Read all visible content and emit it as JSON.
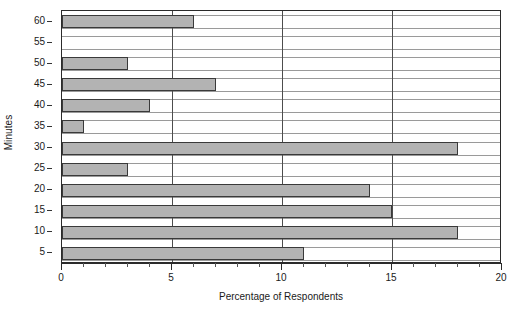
{
  "chart_data": {
    "type": "bar",
    "orientation": "horizontal",
    "title": "",
    "xlabel": "Percentage of Respondents",
    "ylabel": "Minutes",
    "categories": [
      "5",
      "10",
      "15",
      "20",
      "25",
      "30",
      "35",
      "40",
      "45",
      "50",
      "55",
      "60"
    ],
    "values": [
      11,
      18,
      15,
      14,
      3,
      18,
      1,
      4,
      7,
      3,
      0,
      6
    ],
    "xlim": [
      0,
      20
    ],
    "xticks": [
      0,
      5,
      10,
      15,
      20
    ],
    "xtick_labels": [
      "0",
      "5",
      "10",
      "15",
      "20"
    ],
    "x_minor_tick_step": 1,
    "yticks": [
      "5",
      "10",
      "15",
      "20",
      "25",
      "30",
      "35",
      "40",
      "45",
      "50",
      "55",
      "60"
    ],
    "gridlines": {
      "vertical_at": [
        5,
        10,
        15
      ],
      "horizontal": true
    },
    "legend": null,
    "colors": {
      "bar_fill": "#b3b3b3",
      "bar_border": "#3a3a3a",
      "axis": "#2b2b2b",
      "grid": "#9a9a9a",
      "background": "#ffffff",
      "text": "#1a1a1a"
    }
  }
}
